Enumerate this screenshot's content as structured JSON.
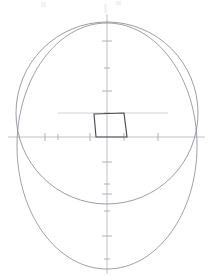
{
  "canvas": {
    "width": 210,
    "height": 276,
    "background": "#ffffff",
    "title": "Face construction guide"
  },
  "colors": {
    "outline": "#8e8e99",
    "cranium": "#8a8a94",
    "nose": "#4a4a52",
    "axis": "#b9b9c2",
    "gridline": "#dedee4",
    "tick": "#a8a8b2",
    "artifact": "#f2f2f4"
  },
  "chart_data": {
    "type": "scatter",
    "title": "",
    "xlabel": "",
    "ylabel": "",
    "grid": true,
    "legend_position": "none",
    "axes": {
      "origin_x": 107,
      "origin_y": 137,
      "vertical_axis": {
        "x": 107,
        "y_top": 14,
        "y_bottom": 274
      },
      "horizontal_axis": {
        "y": 137,
        "x_left": 8,
        "x_right": 205
      }
    },
    "ticks": {
      "vertical": [
        {
          "y": 41,
          "half_width": 5
        },
        {
          "y": 68,
          "half_width": 3
        },
        {
          "y": 91,
          "half_width": 5
        },
        {
          "y": 113,
          "half_width": 3
        },
        {
          "y": 162,
          "half_width": 5
        },
        {
          "y": 184,
          "half_width": 3
        },
        {
          "y": 194,
          "half_width": 5
        },
        {
          "y": 211,
          "half_width": 3
        },
        {
          "y": 236,
          "half_width": 5
        },
        {
          "y": 259,
          "half_width": 3
        }
      ],
      "horizontal": [
        {
          "x": 45,
          "half_height": 4
        },
        {
          "x": 58,
          "half_height": 3
        },
        {
          "x": 90,
          "half_height": 4
        },
        {
          "x": 124,
          "half_height": 4
        },
        {
          "x": 158,
          "half_height": 4
        }
      ]
    },
    "gridlines": [
      {
        "orientation": "horizontal",
        "y": 68,
        "x1": 40,
        "x2": 172
      },
      {
        "orientation": "horizontal",
        "y": 113,
        "x1": 58,
        "x2": 168
      }
    ],
    "shapes": [
      {
        "name": "head-outline-egg",
        "type": "ellipse-path",
        "cx": 107,
        "cy": 146,
        "rx": 90,
        "ry": 123,
        "top_y": 23,
        "bottom_y": 269
      },
      {
        "name": "cranium-circle",
        "type": "circle",
        "cx": 107,
        "cy": 113,
        "r": 91,
        "top_y": 22,
        "bottom_y": 204
      },
      {
        "name": "nose-trapezoid",
        "type": "polygon",
        "points": [
          {
            "x": 94,
            "y": 114
          },
          {
            "x": 124,
            "y": 113
          },
          {
            "x": 127,
            "y": 137
          },
          {
            "x": 96,
            "y": 137
          }
        ]
      }
    ]
  },
  "artifacts": [
    {
      "name": "top-left-speck",
      "x": 41,
      "y": 2,
      "w": 5,
      "h": 5
    },
    {
      "name": "top-right-speck",
      "x": 116,
      "y": 1,
      "w": 5,
      "h": 4
    },
    {
      "name": "top-center-smudge",
      "x": 104,
      "y": 4,
      "w": 3,
      "h": 9
    }
  ]
}
